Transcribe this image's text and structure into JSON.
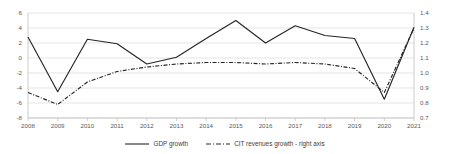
{
  "chart_data": {
    "type": "line",
    "title": "",
    "subtitle": "",
    "xlabel": "",
    "ylabel": "",
    "categories": [
      "2008",
      "2009",
      "2010",
      "2011",
      "2012",
      "2013",
      "2014",
      "2015",
      "2016",
      "2017",
      "2018",
      "2019",
      "2020",
      "2021"
    ],
    "series": [
      {
        "name": "GDP growth",
        "axis": "left",
        "style": "solid",
        "color": "#262626",
        "values": [
          2.8,
          -4.5,
          2.5,
          1.9,
          -0.8,
          0.1,
          2.6,
          5.0,
          2.0,
          4.3,
          3.0,
          2.6,
          -5.5,
          4.1
        ]
      },
      {
        "name": "CIT revenues growth - right axis",
        "axis": "right",
        "style": "dash-dot",
        "color": "#262626",
        "values": [
          0.87,
          0.79,
          0.94,
          1.01,
          1.04,
          1.06,
          1.07,
          1.07,
          1.06,
          1.07,
          1.06,
          1.03,
          0.87,
          1.3
        ]
      }
    ],
    "ylim": [
      -8,
      6
    ],
    "y_ticks": [
      "6",
      "4",
      "2",
      "0",
      "-2",
      "-4",
      "-6",
      "-8"
    ],
    "y2lim": [
      0.7,
      1.4
    ],
    "y2_ticks": [
      "1.4",
      "1.3",
      "1.2",
      "1.1",
      "1.0",
      "0.9",
      "0.8",
      "0.7"
    ],
    "grid": true,
    "legend_position": "bottom"
  },
  "legend": {
    "items": [
      {
        "label": "GDP growth",
        "marker": "solid-line-swatch"
      },
      {
        "label": "CIT revenues growth - right axis",
        "marker": "dash-dot-line-swatch"
      }
    ]
  },
  "colors": {
    "line": "#262626",
    "grid": "#d9d9d9",
    "axis": "#bfbfbf",
    "text": "#5a5a5a"
  }
}
